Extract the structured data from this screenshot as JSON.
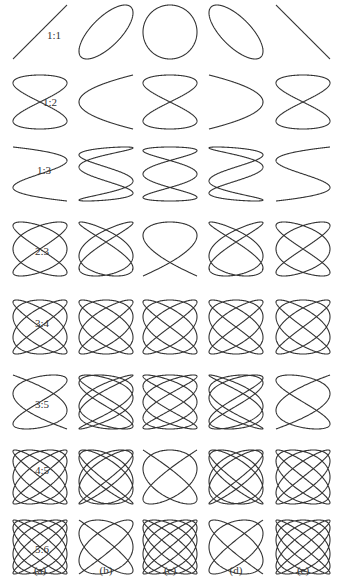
{
  "figure": {
    "title": "",
    "stroke_color": "#333333",
    "columns": [
      {
        "label": "(a)",
        "cx": 40,
        "phase_deg": 0
      },
      {
        "label": "(b)",
        "cx": 106,
        "phase_deg": 45
      },
      {
        "label": "(c)",
        "cx": 170,
        "phase_deg": 90
      },
      {
        "label": "(d)",
        "cx": 236,
        "phase_deg": 135
      },
      {
        "label": "(e)",
        "cx": 303,
        "phase_deg": 180
      }
    ],
    "rows": [
      {
        "label": "1:1",
        "a": 1,
        "b": 1,
        "cy": 32,
        "label_dx": 14,
        "label_dy": 3
      },
      {
        "label": "1:2",
        "a": 1,
        "b": 2,
        "cy": 102,
        "label_dx": 10,
        "label_dy": 0
      },
      {
        "label": "1:3",
        "a": 1,
        "b": 3,
        "cy": 174,
        "label_dx": 4,
        "label_dy": -4
      },
      {
        "label": "2:3",
        "a": 2,
        "b": 3,
        "cy": 249,
        "label_dx": 2,
        "label_dy": 2
      },
      {
        "label": "3:4",
        "a": 3,
        "b": 4,
        "cy": 327,
        "label_dx": 2,
        "label_dy": -4
      },
      {
        "label": "3:5",
        "a": 3,
        "b": 5,
        "cy": 402,
        "label_dx": 2,
        "label_dy": 2
      },
      {
        "label": "4:5",
        "a": 4,
        "b": 5,
        "cy": 477,
        "label_dx": 2,
        "label_dy": -7
      },
      {
        "label": "5:6",
        "a": 5,
        "b": 6,
        "cy": 547,
        "label_dx": 2,
        "label_dy": 2
      }
    ],
    "half_width": 27,
    "half_height": 27
  }
}
